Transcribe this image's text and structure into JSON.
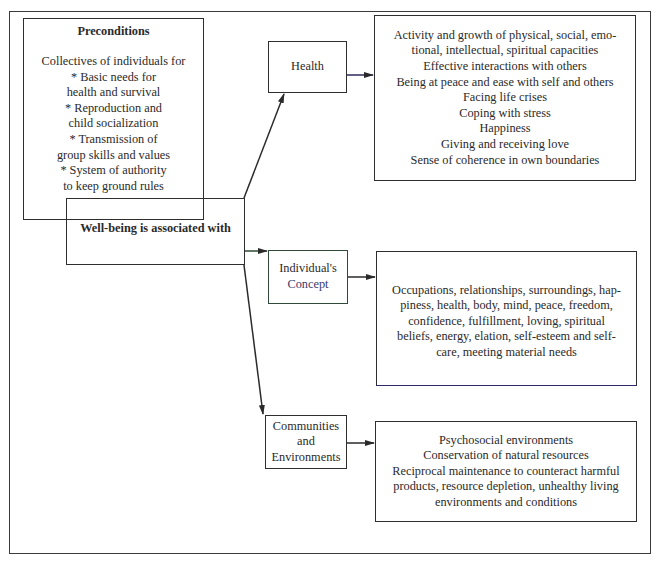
{
  "diagram": {
    "preconditions": {
      "title": "Preconditions",
      "lines": [
        "Collectives of individuals for",
        "* Basic needs for",
        "health and survival",
        "* Reproduction and",
        "child socialization",
        "* Transmission of",
        "group skills and values",
        "* System of authority",
        "to keep ground rules"
      ]
    },
    "central": {
      "title": "Well-being is associated with"
    },
    "branches": [
      {
        "label_lines": [
          "Health"
        ],
        "detail_lines": [
          "Activity and growth of physical, social, emo-",
          "tional, intellectual, spiritual capacities",
          "Effective interactions with others",
          "Being at peace and ease with self and others",
          "Facing life crises",
          "Coping with stress",
          "Happiness",
          "Giving and receiving love",
          "Sense of coherence in own boundaries"
        ]
      },
      {
        "label_lines": [
          "Individual's",
          "Concept"
        ],
        "detail_lines": [
          "Occupations, relationships, surroundings, hap-",
          "piness, health, body, mind, peace, freedom,",
          "confidence, fulfillment, loving, spiritual",
          "beliefs, energy, elation, self-esteem and self-",
          "care, meeting material needs"
        ]
      },
      {
        "label_lines": [
          "Communities",
          "and",
          "Environments"
        ],
        "detail_lines": [
          "Psychosocial environments",
          "Conservation of natural resources",
          "Reciprocal maintenance to counteract harmful",
          "products, resource depletion, unhealthy living",
          "environments and conditions"
        ]
      }
    ],
    "colors": {
      "line": "#2e2e2e",
      "background": "#ffffff"
    }
  }
}
